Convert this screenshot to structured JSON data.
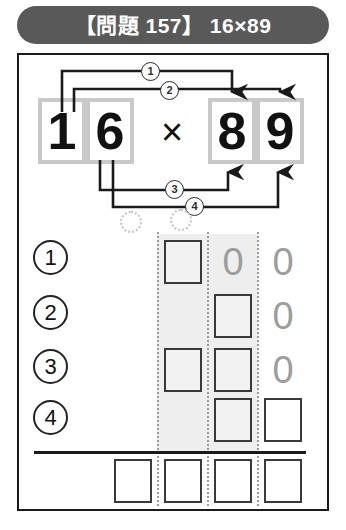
{
  "header": {
    "title": "【問題 157】 16×89",
    "badge_color": "#595959",
    "text_color": "#ffffff"
  },
  "equation": {
    "multiplier": {
      "tens": "1",
      "ones": "6"
    },
    "multiplicand": {
      "tens": "8",
      "ones": "9"
    },
    "operator": "×",
    "expression": "16×89",
    "cell_border_color": "#c9c9c9"
  },
  "arrows": [
    {
      "id": "1",
      "label": "①",
      "badge_text": "1",
      "from": "multiplier-tens",
      "to": "multiplicand-tens",
      "direction": "down",
      "product": "1×8"
    },
    {
      "id": "2",
      "label": "②",
      "badge_text": "2",
      "from": "multiplier-tens",
      "to": "multiplicand-ones",
      "direction": "down",
      "product": "1×9"
    },
    {
      "id": "3",
      "label": "③",
      "badge_text": "3",
      "from": "multiplier-ones",
      "to": "multiplicand-tens",
      "direction": "up",
      "product": "6×8"
    },
    {
      "id": "4",
      "label": "④",
      "badge_text": "4",
      "from": "multiplier-ones",
      "to": "multiplicand-ones",
      "direction": "up",
      "product": "6×9"
    }
  ],
  "grid": {
    "row_labels": [
      "1",
      "2",
      "3",
      "4"
    ],
    "column_count": 4,
    "shaded_columns": [
      2,
      3
    ],
    "carry_circles": 2,
    "rows": [
      {
        "label": "1",
        "cells": [
          {
            "col": 1,
            "type": "empty",
            "value": ""
          },
          {
            "col": 2,
            "type": "box",
            "value": ""
          },
          {
            "col": 3,
            "type": "zero",
            "value": "0"
          },
          {
            "col": 4,
            "type": "zero",
            "value": "0"
          }
        ]
      },
      {
        "label": "2",
        "cells": [
          {
            "col": 1,
            "type": "empty",
            "value": ""
          },
          {
            "col": 2,
            "type": "empty",
            "value": ""
          },
          {
            "col": 3,
            "type": "box",
            "value": ""
          },
          {
            "col": 4,
            "type": "zero",
            "value": "0"
          }
        ]
      },
      {
        "label": "3",
        "cells": [
          {
            "col": 1,
            "type": "empty",
            "value": ""
          },
          {
            "col": 2,
            "type": "box",
            "value": ""
          },
          {
            "col": 3,
            "type": "box",
            "value": ""
          },
          {
            "col": 4,
            "type": "zero",
            "value": "0"
          }
        ]
      },
      {
        "label": "4",
        "cells": [
          {
            "col": 1,
            "type": "empty",
            "value": ""
          },
          {
            "col": 2,
            "type": "empty",
            "value": ""
          },
          {
            "col": 3,
            "type": "box",
            "value": ""
          },
          {
            "col": 4,
            "type": "box",
            "value": ""
          }
        ]
      }
    ],
    "answer_row": [
      {
        "col": 1,
        "value": ""
      },
      {
        "col": 2,
        "value": ""
      },
      {
        "col": 3,
        "value": ""
      },
      {
        "col": 4,
        "value": ""
      }
    ]
  },
  "colors": {
    "ink": "#1a1a1a",
    "shade": "#eeeeee",
    "zero_gray": "#9d9d9d",
    "divider_gray": "#9a9a9a"
  }
}
